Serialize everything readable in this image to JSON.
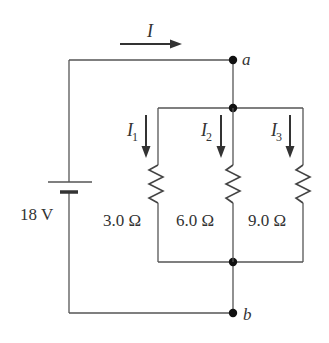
{
  "diagram": {
    "type": "circuit",
    "total_current_label": "I",
    "battery": {
      "voltage_label": "18 V"
    },
    "nodes": [
      {
        "id": "a",
        "label": "a"
      },
      {
        "id": "b",
        "label": "b"
      }
    ],
    "branches": [
      {
        "current_symbol": "I",
        "current_subscript": "1",
        "resistance_label": "3.0 Ω"
      },
      {
        "current_symbol": "I",
        "current_subscript": "2",
        "resistance_label": "6.0 Ω"
      },
      {
        "current_symbol": "I",
        "current_subscript": "3",
        "resistance_label": "9.0 Ω"
      }
    ]
  },
  "colors": {
    "wire": "#555555",
    "node": "#111111",
    "text": "#333333",
    "background": "#ffffff"
  }
}
